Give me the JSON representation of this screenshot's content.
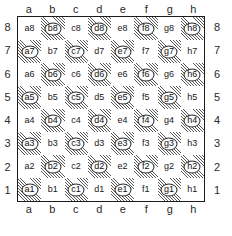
{
  "diagram": {
    "caption_fragment": "",
    "files": [
      "a",
      "b",
      "c",
      "d",
      "e",
      "f",
      "g",
      "h"
    ],
    "ranks": [
      "8",
      "7",
      "6",
      "5",
      "4",
      "3",
      "2",
      "1"
    ],
    "colors": {
      "light_square": "#ffffff",
      "dark_square_hatch": "#282828",
      "border": "#1c1c1c",
      "label_text": "#181818",
      "coordinate_text": "#2a2a2a"
    },
    "legend": {
      "dark_square_style": "diagonal-hatch-with-ellipse-ring",
      "light_square_style": "plain-white"
    },
    "squares": [
      [
        {
          "name": "a8",
          "shade": "light"
        },
        {
          "name": "b8",
          "shade": "dark"
        },
        {
          "name": "c8",
          "shade": "light"
        },
        {
          "name": "d8",
          "shade": "dark"
        },
        {
          "name": "e8",
          "shade": "light"
        },
        {
          "name": "f8",
          "shade": "dark"
        },
        {
          "name": "g8",
          "shade": "light"
        },
        {
          "name": "h8",
          "shade": "dark"
        }
      ],
      [
        {
          "name": "a7",
          "shade": "dark"
        },
        {
          "name": "b7",
          "shade": "light"
        },
        {
          "name": "c7",
          "shade": "dark"
        },
        {
          "name": "d7",
          "shade": "light"
        },
        {
          "name": "e7",
          "shade": "dark"
        },
        {
          "name": "f7",
          "shade": "light"
        },
        {
          "name": "g7",
          "shade": "dark"
        },
        {
          "name": "h7",
          "shade": "light"
        }
      ],
      [
        {
          "name": "a6",
          "shade": "light"
        },
        {
          "name": "b6",
          "shade": "dark"
        },
        {
          "name": "c6",
          "shade": "light"
        },
        {
          "name": "d6",
          "shade": "dark"
        },
        {
          "name": "e6",
          "shade": "light"
        },
        {
          "name": "f6",
          "shade": "dark"
        },
        {
          "name": "g6",
          "shade": "light"
        },
        {
          "name": "h6",
          "shade": "dark"
        }
      ],
      [
        {
          "name": "a5",
          "shade": "dark"
        },
        {
          "name": "b5",
          "shade": "light"
        },
        {
          "name": "c5",
          "shade": "dark"
        },
        {
          "name": "d5",
          "shade": "light"
        },
        {
          "name": "e5",
          "shade": "dark"
        },
        {
          "name": "f5",
          "shade": "light"
        },
        {
          "name": "g5",
          "shade": "dark"
        },
        {
          "name": "h5",
          "shade": "light"
        }
      ],
      [
        {
          "name": "a4",
          "shade": "light"
        },
        {
          "name": "b4",
          "shade": "dark"
        },
        {
          "name": "c4",
          "shade": "light"
        },
        {
          "name": "d4",
          "shade": "dark"
        },
        {
          "name": "e4",
          "shade": "light"
        },
        {
          "name": "f4",
          "shade": "dark"
        },
        {
          "name": "g4",
          "shade": "light"
        },
        {
          "name": "h4",
          "shade": "dark"
        }
      ],
      [
        {
          "name": "a3",
          "shade": "dark"
        },
        {
          "name": "b3",
          "shade": "light"
        },
        {
          "name": "c3",
          "shade": "dark"
        },
        {
          "name": "d3",
          "shade": "light"
        },
        {
          "name": "e3",
          "shade": "dark"
        },
        {
          "name": "f3",
          "shade": "light"
        },
        {
          "name": "g3",
          "shade": "dark"
        },
        {
          "name": "h3",
          "shade": "light"
        }
      ],
      [
        {
          "name": "a2",
          "shade": "light"
        },
        {
          "name": "b2",
          "shade": "dark"
        },
        {
          "name": "c2",
          "shade": "light"
        },
        {
          "name": "d2",
          "shade": "dark"
        },
        {
          "name": "e2",
          "shade": "light"
        },
        {
          "name": "f2",
          "shade": "dark"
        },
        {
          "name": "g2",
          "shade": "light"
        },
        {
          "name": "h2",
          "shade": "dark"
        }
      ],
      [
        {
          "name": "a1",
          "shade": "dark"
        },
        {
          "name": "b1",
          "shade": "light"
        },
        {
          "name": "c1",
          "shade": "dark"
        },
        {
          "name": "d1",
          "shade": "light"
        },
        {
          "name": "e1",
          "shade": "dark"
        },
        {
          "name": "f1",
          "shade": "light"
        },
        {
          "name": "g1",
          "shade": "dark"
        },
        {
          "name": "h1",
          "shade": "light"
        }
      ]
    ]
  }
}
